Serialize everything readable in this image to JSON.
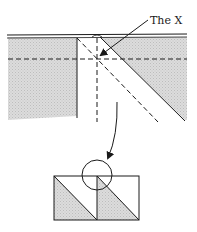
{
  "diagram": {
    "annotation_label": "The X",
    "colors": {
      "ink": "#1a1a1a",
      "shade": "#d4d4d4",
      "background": "#ffffff"
    },
    "top_figure": {
      "description": "Folded paper edge showing where creases cross to form an X",
      "elements": [
        "paper-top-edge",
        "shaded-paper",
        "horizontal-dashed-crease",
        "vertical-dashed-crease",
        "diagonal-dashed-crease",
        "diagonal-fold-edge",
        "vertical-fold-edge",
        "pointer-arrow"
      ]
    },
    "bottom_figure": {
      "description": "Two squares with shaded lower-left triangles; circle highlights the junction",
      "elements": [
        "square-left",
        "square-right",
        "highlight-circle",
        "curved-arrow"
      ]
    }
  }
}
